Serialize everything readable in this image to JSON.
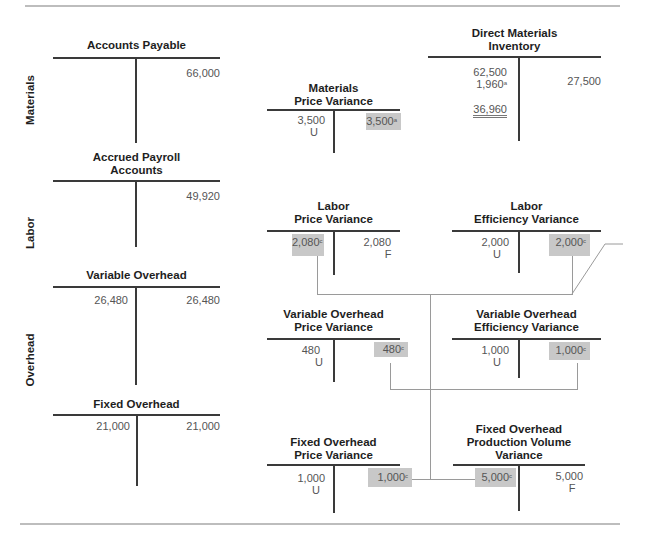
{
  "section_labels": {
    "materials": "Materials",
    "labor": "Labor",
    "overhead": "Overhead"
  },
  "accounts": {
    "accounts_payable": {
      "title": "Accounts Payable",
      "credit": "66,000"
    },
    "direct_materials_inventory": {
      "title_line1": "Direct Materials",
      "title_line2": "Inventory",
      "debit_1": "62,500",
      "debit_2": "1,960",
      "debit_2_note": "a",
      "debit_balance": "36,960",
      "credit": "27,500"
    },
    "materials_price_variance": {
      "title_line1": "Materials",
      "title_line2": "Price Variance",
      "debit": "3,500",
      "debit_flag": "U",
      "credit_closing": "3,500",
      "credit_closing_note": "a"
    },
    "accrued_payroll": {
      "title_line1": "Accrued Payroll",
      "title_line2": "Accounts",
      "credit": "49,920"
    },
    "labor_price_variance": {
      "title_line1": "Labor",
      "title_line2": "Price Variance",
      "debit_closing": "2,080",
      "debit_closing_note": "c",
      "credit": "2,080",
      "credit_flag": "F"
    },
    "labor_efficiency_variance": {
      "title_line1": "Labor",
      "title_line2": "Efficiency Variance",
      "debit": "2,000",
      "debit_flag": "U",
      "credit_closing": "2,000",
      "credit_closing_note": "c"
    },
    "variable_overhead": {
      "title": "Variable Overhead",
      "debit": "26,480",
      "credit": "26,480"
    },
    "voh_price_variance": {
      "title_line1": "Variable Overhead",
      "title_line2": "Price Variance",
      "debit": "480",
      "debit_flag": "U",
      "credit_closing": "480",
      "credit_closing_note": "c"
    },
    "voh_efficiency_variance": {
      "title_line1": "Variable Overhead",
      "title_line2": "Efficiency Variance",
      "debit": "1,000",
      "debit_flag": "U",
      "credit_closing": "1,000",
      "credit_closing_note": "c"
    },
    "fixed_overhead": {
      "title": "Fixed Overhead",
      "debit": "21,000",
      "credit": "21,000"
    },
    "foh_price_variance": {
      "title_line1": "Fixed Overhead",
      "title_line2": "Price Variance",
      "debit": "1,000",
      "debit_flag": "U",
      "credit_closing": "1,000",
      "credit_closing_note": "c"
    },
    "foh_volume_variance": {
      "title_line1": "Fixed Overhead",
      "title_line2": "Production Volume",
      "title_line3": "Variance",
      "debit_closing": "5,000",
      "debit_closing_note": "c",
      "credit": "5,000",
      "credit_flag": "F"
    }
  },
  "colors": {
    "shade": "#c8c8c8",
    "t_line": "#3a3a3a",
    "connector": "#9a9a9a",
    "rule": "#bdbdbd"
  }
}
